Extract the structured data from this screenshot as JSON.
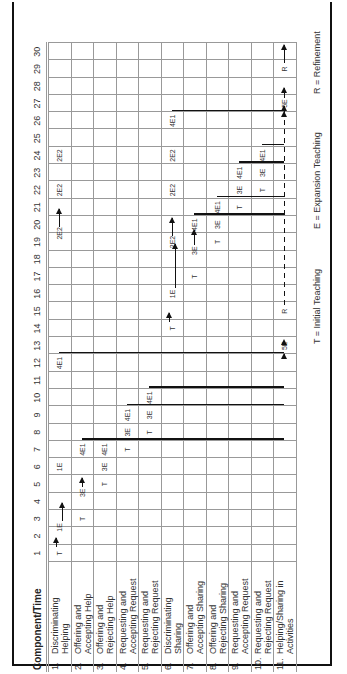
{
  "header": {
    "component_time_label": "Component/Time"
  },
  "time_labels": [
    "1",
    "2",
    "3",
    "4",
    "5",
    "6",
    "7",
    "8",
    "9",
    "10",
    "11",
    "12",
    "13",
    "14",
    "15",
    "16",
    "17",
    "18",
    "19",
    "20",
    "21",
    "22",
    "23",
    "24",
    "25",
    "26",
    "27",
    "28",
    "29",
    "30"
  ],
  "rows": [
    {
      "num": "1.",
      "label": "Discriminating Helping"
    },
    {
      "num": "2.",
      "label": "Offering and Accepting Help"
    },
    {
      "num": "3.",
      "label": "Offering and Rejecting Help"
    },
    {
      "num": "4.",
      "label": "Requesting and Accepting Request"
    },
    {
      "num": "5.",
      "label": "Requesting and Rejecting Request"
    },
    {
      "num": "6.",
      "label": "Discriminating Sharing"
    },
    {
      "num": "7.",
      "label": "Offering and Accepting Sharing"
    },
    {
      "num": "8.",
      "label": "Offering and Rejecting Sharing"
    },
    {
      "num": "9.",
      "label": "Requesting and Accepting Request"
    },
    {
      "num": "10.",
      "label": "Requesting and Rejecting Request"
    },
    {
      "num": "11.",
      "label": "Helping/Sharing in Activities"
    }
  ],
  "marks": [
    {
      "row": 1,
      "t": 1,
      "text": "T"
    },
    {
      "row": 1,
      "t": 2.5,
      "text": "1E"
    },
    {
      "row": 1,
      "t": 6,
      "text": "1E"
    },
    {
      "row": 1,
      "t": 19.5,
      "text": "2E2"
    },
    {
      "row": 1,
      "t": 22,
      "text": "2E2"
    },
    {
      "row": 1,
      "t": 24,
      "text": "2E2"
    },
    {
      "row": 2,
      "t": 3,
      "text": "T"
    },
    {
      "row": 2,
      "t": 4.5,
      "text": "3E"
    },
    {
      "row": 2,
      "t": 7,
      "text": "4E1"
    },
    {
      "row": 3,
      "t": 5,
      "text": "T"
    },
    {
      "row": 3,
      "t": 6,
      "text": "3E"
    },
    {
      "row": 3,
      "t": 7,
      "text": "4E1"
    },
    {
      "row": 4,
      "t": 7,
      "text": "T"
    },
    {
      "row": 4,
      "t": 8,
      "text": "3E"
    },
    {
      "row": 4,
      "t": 9,
      "text": "4E1"
    },
    {
      "row": 5,
      "t": 8,
      "text": "T"
    },
    {
      "row": 5,
      "t": 9,
      "text": "3E"
    },
    {
      "row": 5,
      "t": 10,
      "text": "4E1"
    },
    {
      "row": 1,
      "t": 12,
      "text": "4E1"
    },
    {
      "row": 6,
      "t": 14,
      "text": "T"
    },
    {
      "row": 6,
      "t": 16,
      "text": "1E"
    },
    {
      "row": 6,
      "t": 19,
      "text": "2E2"
    },
    {
      "row": 6,
      "t": 22,
      "text": "2E2"
    },
    {
      "row": 6,
      "t": 24,
      "text": "2E2"
    },
    {
      "row": 6,
      "t": 26,
      "text": "4E1"
    },
    {
      "row": 7,
      "t": 17,
      "text": "T"
    },
    {
      "row": 7,
      "t": 18.5,
      "text": "3E"
    },
    {
      "row": 7,
      "t": 20,
      "text": "4E1"
    },
    {
      "row": 8,
      "t": 19,
      "text": "T"
    },
    {
      "row": 8,
      "t": 20,
      "text": "3E"
    },
    {
      "row": 8,
      "t": 21,
      "text": "4E1"
    },
    {
      "row": 9,
      "t": 21,
      "text": "T"
    },
    {
      "row": 9,
      "t": 22,
      "text": "3E"
    },
    {
      "row": 9,
      "t": 23,
      "text": "4E1"
    },
    {
      "row": 10,
      "t": 22,
      "text": "T"
    },
    {
      "row": 10,
      "t": 23,
      "text": "3E"
    },
    {
      "row": 10,
      "t": 24,
      "text": "4E1"
    },
    {
      "row": 11,
      "t": 13,
      "text": "5E"
    },
    {
      "row": 11,
      "t": 15,
      "text": "R"
    },
    {
      "row": 11,
      "t": 27,
      "text": "5E"
    },
    {
      "row": 11,
      "t": 29,
      "text": "R"
    }
  ],
  "legend": {
    "t": "T  =  Initial Teaching",
    "e": "E  =  Expansion Teaching",
    "r": "R  =  Refinement"
  }
}
